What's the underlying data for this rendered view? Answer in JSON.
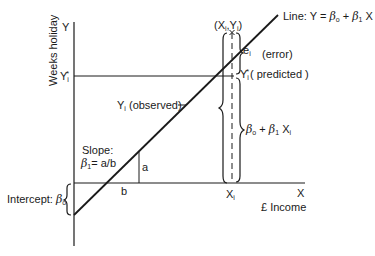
{
  "diagram": {
    "type": "linear-regression-illustration",
    "axes": {
      "y_axis_symbol": "Y",
      "y_axis_title": "Weeks holiday",
      "x_axis_symbol": "X",
      "x_axis_title": "£ Income"
    },
    "line_label": {
      "prefix": "Line: Y = ",
      "beta0": "β",
      "beta0_sub": "o",
      "plus": " + ",
      "beta1": "β",
      "beta1_sub": "1",
      "suffix": " X"
    },
    "point_label": {
      "open": "(X",
      "x_sub": "i",
      "comma": ",Y",
      "y_sub": "i",
      "close": ")"
    },
    "error_label": {
      "symbol": "e",
      "sub": "i",
      "text": "(error)"
    },
    "predicted_label": {
      "symbol": "Y",
      "sub": "i",
      "sup": "*",
      "text": "( predicted )"
    },
    "y_tick_predicted": {
      "symbol": "Y",
      "sub": "i",
      "sup": "*"
    },
    "observed_label": {
      "symbol": "Y",
      "sub": "i",
      "text": "(observed)"
    },
    "fitted_value_label": {
      "beta0": "β",
      "beta0_sub": "o",
      "plus": " + ",
      "beta1": "β",
      "beta1_sub": "1",
      "x": " X",
      "x_sub": "i"
    },
    "slope_label": {
      "title": "Slope:",
      "beta": "β",
      "beta_sub": "1",
      "formula": "= a/b"
    },
    "triangle": {
      "rise_label": "a",
      "run_label": "b"
    },
    "intercept_label": {
      "text": "Intercept: ",
      "beta": "β",
      "beta_sub": "o"
    },
    "x_tick": {
      "symbol": "X",
      "sub": "i"
    },
    "colors": {
      "ink": "#1a1a1a",
      "background": "#ffffff"
    }
  }
}
